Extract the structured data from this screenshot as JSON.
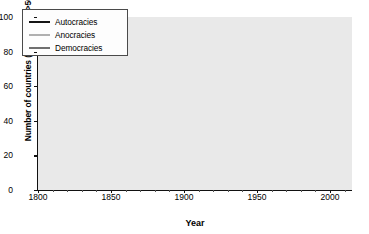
{
  "chart_data": {
    "type": "line",
    "title": "",
    "xlabel": "Year",
    "ylabel": "Number of countries (population >500,000)",
    "xlim": [
      1800,
      2015
    ],
    "ylim": [
      0,
      100
    ],
    "xticks": [
      1800,
      1850,
      1900,
      1950,
      2000
    ],
    "yticks": [
      0,
      20,
      40,
      60,
      80,
      100
    ],
    "grid": true,
    "legend_position": "upper-left-inside",
    "colors": {
      "autocracies": "#141414",
      "anocracies": "#b0b0b0",
      "democracies": "#6f6f6f",
      "plot_background": "#e9e9e9",
      "gridline": "#ffffff",
      "axis": "#111111"
    },
    "series": [
      {
        "name": "Autocracies",
        "color": "#141414",
        "x": [
          1800,
          1805,
          1810,
          1812,
          1815,
          1818,
          1820,
          1822,
          1825,
          1828,
          1830,
          1832,
          1835,
          1838,
          1840,
          1845,
          1848,
          1850,
          1852,
          1855,
          1858,
          1860,
          1863,
          1865,
          1868,
          1870,
          1873,
          1875,
          1878,
          1880,
          1883,
          1885,
          1888,
          1890,
          1893,
          1895,
          1898,
          1900,
          1903,
          1905,
          1908,
          1910,
          1913,
          1915,
          1918,
          1920,
          1922,
          1925,
          1928,
          1930,
          1933,
          1935,
          1938,
          1940,
          1943,
          1945,
          1947,
          1950,
          1953,
          1955,
          1958,
          1960,
          1963,
          1965,
          1968,
          1970,
          1973,
          1975,
          1977,
          1980,
          1983,
          1985,
          1988,
          1990,
          1992,
          1994,
          1996,
          1998,
          2000,
          2003,
          2005,
          2008,
          2010,
          2013,
          2015
        ],
        "values": [
          20,
          19,
          18,
          17,
          19,
          17,
          16,
          22,
          24,
          24,
          26,
          26,
          27,
          27,
          27,
          27,
          27,
          27,
          26,
          26,
          26,
          25,
          24,
          24,
          24,
          23,
          23,
          20,
          18,
          16,
          15,
          15,
          14,
          14,
          14,
          13,
          13,
          13,
          13,
          13,
          13,
          14,
          14,
          15,
          15,
          14,
          16,
          17,
          17,
          18,
          20,
          22,
          24,
          23,
          18,
          16,
          20,
          23,
          28,
          32,
          38,
          44,
          52,
          56,
          62,
          68,
          74,
          80,
          89,
          82,
          85,
          84,
          80,
          58,
          44,
          38,
          34,
          30,
          27,
          25,
          24,
          23,
          22,
          22,
          22
        ]
      },
      {
        "name": "Anocracies",
        "color": "#b0b0b0",
        "x": [
          1800,
          1805,
          1810,
          1812,
          1815,
          1818,
          1820,
          1822,
          1825,
          1828,
          1830,
          1832,
          1835,
          1838,
          1840,
          1845,
          1848,
          1850,
          1852,
          1855,
          1858,
          1860,
          1863,
          1865,
          1868,
          1870,
          1873,
          1875,
          1878,
          1880,
          1883,
          1885,
          1888,
          1890,
          1893,
          1895,
          1898,
          1900,
          1903,
          1905,
          1908,
          1910,
          1913,
          1915,
          1918,
          1920,
          1922,
          1925,
          1928,
          1930,
          1933,
          1935,
          1938,
          1940,
          1943,
          1945,
          1947,
          1950,
          1953,
          1955,
          1958,
          1960,
          1963,
          1965,
          1968,
          1970,
          1973,
          1975,
          1977,
          1980,
          1983,
          1985,
          1988,
          1990,
          1992,
          1994,
          1996,
          1998,
          2000,
          2003,
          2005,
          2008,
          2010,
          2013,
          2015
        ],
        "values": [
          1,
          1,
          1,
          2,
          3,
          4,
          6,
          8,
          10,
          11,
          12,
          12,
          13,
          13,
          14,
          14,
          15,
          16,
          17,
          18,
          19,
          20,
          21,
          22,
          24,
          26,
          27,
          29,
          31,
          33,
          35,
          36,
          37,
          38,
          39,
          39,
          40,
          40,
          39,
          40,
          40,
          40,
          39,
          38,
          38,
          37,
          38,
          38,
          38,
          39,
          39,
          38,
          38,
          38,
          31,
          24,
          25,
          26,
          27,
          28,
          28,
          29,
          30,
          31,
          30,
          29,
          28,
          26,
          25,
          24,
          22,
          20,
          19,
          24,
          33,
          40,
          44,
          45,
          46,
          48,
          47,
          46,
          47,
          46,
          47
        ]
      },
      {
        "name": "Democracies",
        "color": "#6f6f6f",
        "x": [
          1800,
          1805,
          1810,
          1812,
          1815,
          1818,
          1820,
          1822,
          1825,
          1828,
          1830,
          1832,
          1835,
          1838,
          1840,
          1845,
          1848,
          1850,
          1852,
          1855,
          1858,
          1860,
          1863,
          1865,
          1868,
          1870,
          1873,
          1875,
          1878,
          1880,
          1883,
          1885,
          1888,
          1890,
          1893,
          1895,
          1898,
          1900,
          1903,
          1905,
          1908,
          1910,
          1913,
          1915,
          1918,
          1920,
          1922,
          1925,
          1928,
          1930,
          1933,
          1935,
          1938,
          1940,
          1943,
          1945,
          1947,
          1950,
          1953,
          1955,
          1958,
          1960,
          1963,
          1965,
          1968,
          1970,
          1973,
          1975,
          1977,
          1980,
          1983,
          1985,
          1988,
          1990,
          1992,
          1994,
          1996,
          1998,
          2000,
          2003,
          2005,
          2008,
          2010,
          2013,
          2015
        ],
        "values": [
          0,
          0,
          0,
          0,
          0,
          0,
          0,
          0,
          0,
          0,
          1,
          1,
          1,
          1,
          1,
          1,
          2,
          2,
          2,
          2,
          2,
          2,
          2,
          3,
          3,
          4,
          4,
          5,
          5,
          6,
          6,
          7,
          7,
          8,
          8,
          9,
          9,
          10,
          10,
          11,
          11,
          12,
          13,
          13,
          14,
          20,
          22,
          23,
          23,
          21,
          19,
          18,
          16,
          13,
          10,
          18,
          20,
          22,
          23,
          24,
          25,
          26,
          28,
          29,
          30,
          31,
          33,
          34,
          34,
          36,
          36,
          38,
          40,
          44,
          52,
          58,
          62,
          66,
          70,
          76,
          80,
          86,
          90,
          92,
          93
        ]
      }
    ],
    "legend": [
      {
        "label": "Autocracies",
        "color": "#141414"
      },
      {
        "label": "Anocracies",
        "color": "#b0b0b0"
      },
      {
        "label": "Democracies",
        "color": "#6f6f6f"
      }
    ]
  }
}
